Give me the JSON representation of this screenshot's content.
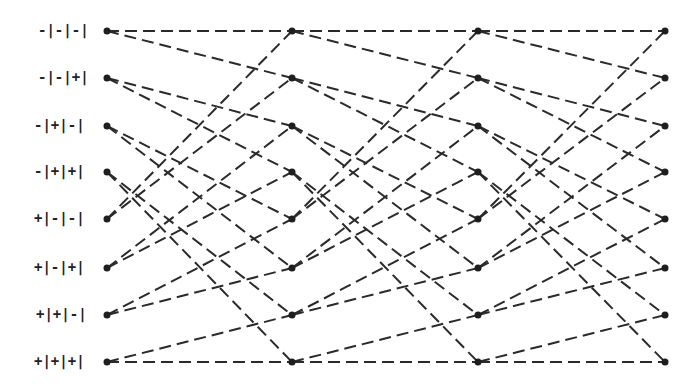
{
  "diagram": {
    "type": "trellis",
    "columns_x": [
      107,
      292,
      478,
      665
    ],
    "rows_y": [
      31,
      78,
      126,
      172,
      219,
      268,
      315,
      362
    ],
    "states": [
      {
        "label": "-|-|-|"
      },
      {
        "label": "-|-|+|"
      },
      {
        "label": "-|+|-|"
      },
      {
        "label": "-|+|+|"
      },
      {
        "label": "+|-|-|"
      },
      {
        "label": "+|-|+|"
      },
      {
        "label": "+|+|-|"
      },
      {
        "label": "+|+|+|"
      }
    ],
    "transitions": [
      [
        0,
        0
      ],
      [
        0,
        1
      ],
      [
        1,
        2
      ],
      [
        1,
        3
      ],
      [
        2,
        4
      ],
      [
        2,
        5
      ],
      [
        3,
        6
      ],
      [
        3,
        7
      ],
      [
        4,
        0
      ],
      [
        4,
        1
      ],
      [
        5,
        2
      ],
      [
        5,
        3
      ],
      [
        6,
        4
      ],
      [
        6,
        5
      ],
      [
        7,
        6
      ],
      [
        7,
        7
      ]
    ],
    "line_style": "dashed",
    "line_color": "#2a2a2a",
    "dot_color": "#1e1e1e"
  }
}
